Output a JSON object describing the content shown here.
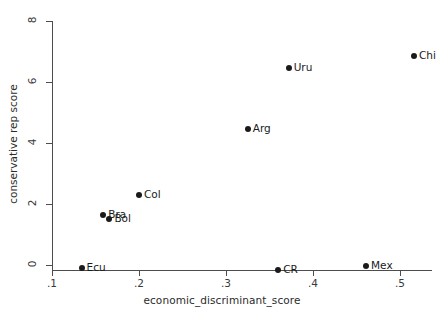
{
  "chart_data": {
    "type": "scatter",
    "title": "",
    "xlabel": "economic_discriminant_score",
    "ylabel": "conservative rep score",
    "xlim": [
      0.1,
      0.52
    ],
    "ylim": [
      0,
      8
    ],
    "xticks": [
      ".1",
      ".2",
      ".3",
      ".4",
      ".5"
    ],
    "xtick_values": [
      0.1,
      0.2,
      0.3,
      0.4,
      0.5
    ],
    "yticks": [
      "0",
      "2",
      "4",
      "6",
      "8"
    ],
    "ytick_values": [
      0,
      2,
      4,
      6,
      8
    ],
    "grid": false,
    "legend": null,
    "marker_color": "#1a1a1a",
    "axis_color": "#4d4d4d",
    "background": "#ffffff",
    "points": [
      {
        "label": "Ecu",
        "x": 0.134,
        "y": -0.1,
        "label_side": "right"
      },
      {
        "label": "Bra",
        "x": 0.159,
        "y": 1.63,
        "label_side": "right"
      },
      {
        "label": "Bol",
        "x": 0.166,
        "y": 1.5,
        "label_side": "right"
      },
      {
        "label": "Col",
        "x": 0.2,
        "y": 2.3,
        "label_side": "right"
      },
      {
        "label": "Arg",
        "x": 0.325,
        "y": 4.45,
        "label_side": "right"
      },
      {
        "label": "Uru",
        "x": 0.372,
        "y": 6.45,
        "label_side": "right"
      },
      {
        "label": "CR",
        "x": 0.36,
        "y": -0.15,
        "label_side": "right"
      },
      {
        "label": "Mex",
        "x": 0.461,
        "y": -0.03,
        "label_side": "right"
      },
      {
        "label": "Chi",
        "x": 0.516,
        "y": 6.85,
        "label_side": "right"
      }
    ]
  }
}
